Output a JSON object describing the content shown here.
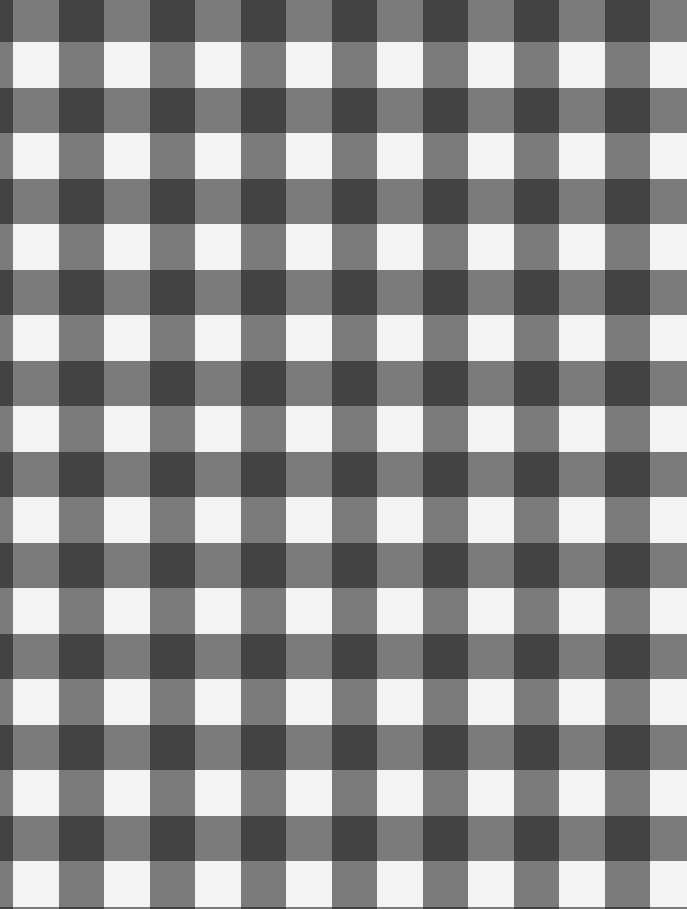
{
  "pattern": {
    "type": "gingham-check",
    "period_px": 91,
    "band_px": 45.5,
    "offset_x_px": 13,
    "offset_y_px": 42,
    "colors": {
      "light": "#f3f3f3",
      "mid": "#7b7b7b",
      "dark": "#434343"
    }
  }
}
